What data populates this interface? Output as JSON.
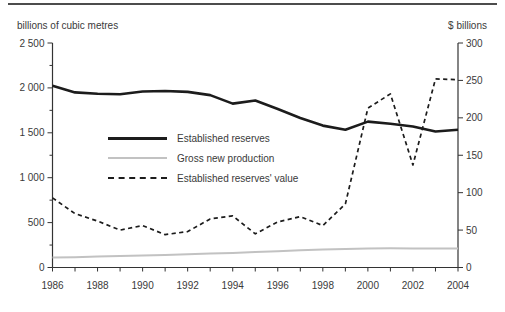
{
  "chart_data": {
    "type": "line",
    "title": "",
    "x": [
      1986,
      1987,
      1988,
      1989,
      1990,
      1991,
      1992,
      1993,
      1994,
      1995,
      1996,
      1997,
      1998,
      1999,
      2000,
      2001,
      2002,
      2003,
      2004
    ],
    "x_axis": {
      "label_years": [
        1986,
        1988,
        1990,
        1992,
        1994,
        1996,
        1998,
        2000,
        2002,
        2004
      ],
      "labels": [
        "1986",
        "1988",
        "1990",
        "1992",
        "1994",
        "1996",
        "1998",
        "2000",
        "2002",
        "2004"
      ]
    },
    "left_axis": {
      "title": "billions of cubic metres",
      "min": 0,
      "max": 2500,
      "ticks": [
        {
          "value": 2500,
          "label": "2 500"
        },
        {
          "value": 2000,
          "label": "2 000"
        },
        {
          "value": 1500,
          "label": "1 500"
        },
        {
          "value": 1000,
          "label": "1 000"
        },
        {
          "value": 500,
          "label": "500"
        },
        {
          "value": 0,
          "label": "0"
        }
      ],
      "minor_ticks": [
        250,
        750,
        1250,
        1750,
        2250
      ]
    },
    "right_axis": {
      "title": "$ billions",
      "min": 0,
      "max": 300,
      "ticks": [
        {
          "value": 300,
          "label": "300"
        },
        {
          "value": 250,
          "label": "250"
        },
        {
          "value": 200,
          "label": "200"
        },
        {
          "value": 150,
          "label": "150"
        },
        {
          "value": 100,
          "label": "100"
        },
        {
          "value": 50,
          "label": "50"
        },
        {
          "value": 0,
          "label": "0"
        }
      ]
    },
    "series": [
      {
        "id": "established-reserves",
        "name": "Established reserves",
        "axis": "left",
        "style": "solid",
        "color": "#1c1c1c",
        "width": 2.6,
        "values": [
          2025,
          1950,
          1935,
          1930,
          1960,
          1965,
          1955,
          1920,
          1825,
          1860,
          1765,
          1665,
          1580,
          1535,
          1625,
          1600,
          1570,
          1515,
          1535
        ]
      },
      {
        "id": "gross-new-production",
        "name": "Gross new production",
        "axis": "left",
        "style": "solid",
        "color": "#c2c2c2",
        "width": 2,
        "values": [
          110,
          115,
          122,
          128,
          134,
          140,
          147,
          155,
          163,
          172,
          182,
          192,
          202,
          206,
          210,
          214,
          213,
          211,
          213
        ]
      },
      {
        "id": "established-reserves-value",
        "name": "Established reserves' value",
        "axis": "right",
        "style": "dashed",
        "color": "#1c1c1c",
        "width": 1.7,
        "dash": "4.2 3.4",
        "values": [
          93,
          72,
          62,
          50,
          56,
          44,
          48,
          65,
          69,
          45,
          61,
          68,
          56,
          85,
          213,
          232,
          137,
          252,
          251
        ]
      }
    ],
    "legend_position": "inside-left",
    "grid": false
  }
}
